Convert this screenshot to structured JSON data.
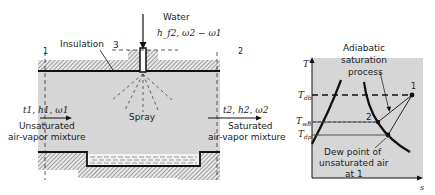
{
  "left_diagram": {
    "water_label": "Water",
    "water_props": "h_f2, ω2 − ω1",
    "insulation_label": "Insulation",
    "station_3": "3",
    "station_1": "1",
    "station_2": "2",
    "spray_label": "Spray",
    "inlet_props": "t1, h1, ω1",
    "inlet_desc_line1": "Unsaturated",
    "inlet_desc_line2": "air-vapor mixture",
    "outlet_props": "t2, h2, ω2",
    "outlet_desc_line1": "Saturated",
    "outlet_desc_line2": "air-vapor mixture"
  },
  "right_diagram": {
    "y_axis": "T",
    "x_axis": "s",
    "process_line1": "Adiabatic",
    "process_line2": "saturation",
    "process_line3": "process",
    "T_db": "T",
    "T_db_sub": "db",
    "T_wb": "T",
    "T_wb_sub": "wb",
    "T_dp": "T",
    "T_dp_sub": "dp",
    "point_1": "1",
    "point_2": "2",
    "dew_line1": "Dew point of",
    "dew_line2": "unsaturated air",
    "dew_line3": "at 1"
  },
  "colors": {
    "fill_gray": "#d6d6d6",
    "line": "#111111"
  }
}
